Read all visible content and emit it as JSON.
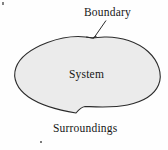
{
  "figure": {
    "background_color": "#fefefe"
  },
  "labels": {
    "boundary": "Boundary",
    "system": "System",
    "surroundings": "Surroundings"
  },
  "shape": {
    "name": "system-blob",
    "fill_color": "#ebebeb",
    "outer_stroke_color": "#2b2b2b",
    "inner_stroke_color": "#b6b6b6",
    "outer_stroke_width": "1",
    "inner_stroke_width": "1"
  },
  "leader": {
    "name": "boundary-leader-line",
    "stroke_color": "#2b2b2b",
    "from": "105,21",
    "to": "93,38"
  },
  "artifacts": {
    "top_left_speck": "scan-speck",
    "bottom_speck": "scan-speck"
  }
}
